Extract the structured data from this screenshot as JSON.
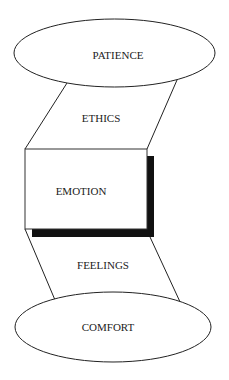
{
  "diagram": {
    "top_ellipse": {
      "label": "PATIENCE"
    },
    "upper_connector": {
      "label": "ETHICS"
    },
    "center_box": {
      "label": "EMOTION"
    },
    "lower_connector": {
      "label": "FEELINGS"
    },
    "bottom_ellipse": {
      "label": "COMFORT"
    }
  }
}
